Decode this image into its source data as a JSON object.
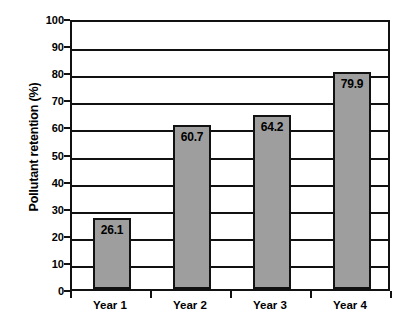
{
  "chart_data": {
    "type": "bar",
    "title": "",
    "subtitle": "",
    "xlabel": "",
    "ylabel": "Pollutant retention (%)",
    "categories": [
      "Year 1",
      "Year 2",
      "Year 3",
      "Year 4"
    ],
    "values": [
      26.1,
      60.7,
      64.2,
      79.9
    ],
    "value_labels": [
      "26.1",
      "60.7",
      "64.2",
      "79.9"
    ],
    "ylim": [
      0,
      100
    ],
    "ytick_labels": [
      "0",
      "10",
      "20",
      "30",
      "40",
      "50",
      "60",
      "70",
      "80",
      "90",
      "100"
    ],
    "ytick_values": [
      0,
      10,
      20,
      30,
      40,
      50,
      60,
      70,
      80,
      90,
      100
    ],
    "grid": "horizontal",
    "legend": "none",
    "colors": {
      "bar_fill": "#9e9e9e",
      "bar_border": "#111111",
      "gridline": "#111111",
      "axis": "#111111",
      "text": "#000000",
      "background": "#ffffff"
    }
  }
}
